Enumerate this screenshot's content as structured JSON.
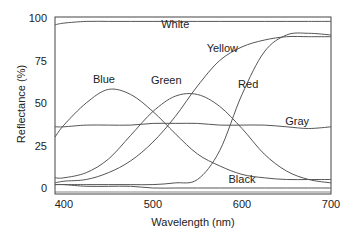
{
  "chart_data": {
    "type": "line",
    "title": "",
    "xlabel": "Wavelength (nm)",
    "ylabel": "Reflectance (%)",
    "xlim": [
      390,
      700
    ],
    "ylim": [
      -3,
      100
    ],
    "xticks": [
      400,
      500,
      600,
      700
    ],
    "yticks": [
      0,
      25,
      50,
      75,
      100
    ],
    "grid": false,
    "legend": "inline labels",
    "x": [
      390,
      400,
      425,
      450,
      475,
      500,
      525,
      550,
      575,
      600,
      625,
      650,
      675,
      700
    ],
    "series": [
      {
        "name": "White",
        "label_pos": [
          525,
          94
        ],
        "values": [
          96,
          97,
          98,
          98,
          98,
          98,
          98,
          98,
          98,
          98,
          98,
          98,
          98,
          98
        ]
      },
      {
        "name": "Yellow",
        "label_pos": [
          578,
          80
        ],
        "values": [
          3,
          4,
          5,
          9,
          16,
          27,
          42,
          60,
          75,
          83,
          87,
          89,
          89,
          89
        ]
      },
      {
        "name": "Red",
        "label_pos": [
          607,
          59
        ],
        "values": [
          2,
          2,
          2,
          2,
          2,
          2,
          3,
          5,
          22,
          55,
          80,
          90,
          91,
          90
        ]
      },
      {
        "name": "Blue",
        "label_pos": [
          445,
          62
        ],
        "values": [
          30,
          37,
          50,
          58,
          55,
          45,
          32,
          20,
          13,
          8,
          6,
          5,
          5,
          5
        ]
      },
      {
        "name": "Green",
        "label_pos": [
          515,
          61
        ],
        "values": [
          6,
          6,
          9,
          17,
          31,
          45,
          54,
          55,
          48,
          35,
          20,
          10,
          5,
          3
        ]
      },
      {
        "name": "Gray",
        "label_pos": [
          662,
          37
        ],
        "values": [
          36,
          36,
          37,
          37,
          37,
          38,
          38,
          38,
          37,
          37,
          37,
          36,
          35,
          36
        ]
      },
      {
        "name": "Black",
        "label_pos": [
          600,
          3
        ],
        "values": [
          2,
          2,
          1,
          1,
          1,
          0,
          0,
          0,
          0,
          0,
          0,
          0,
          0,
          0
        ]
      }
    ],
    "line_color": "#555555"
  }
}
